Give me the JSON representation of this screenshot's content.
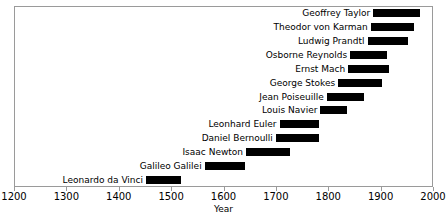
{
  "chart_data": {
    "type": "bar",
    "orientation": "horizontal-range",
    "title": "",
    "xlabel": "Year",
    "ylabel": "",
    "xlim": [
      1200,
      2000
    ],
    "xticks": [
      1200,
      1300,
      1400,
      1500,
      1600,
      1700,
      1800,
      1900,
      2000
    ],
    "xticklabels": [
      "1200",
      "1300",
      "1400",
      "1500",
      "1600",
      "1700",
      "1800",
      "1900",
      "2000"
    ],
    "grid": false,
    "legend": null,
    "categories": [
      "Geoffrey Taylor",
      "Theodor von Karman",
      "Ludwig Prandtl",
      "Osborne Reynolds",
      "Ernst Mach",
      "George Stokes",
      "Jean Poiseuille",
      "Louis Navier",
      "Leonhard Euler",
      "Daniel Bernoulli",
      "Isaac Newton",
      "Galileo Galilei",
      "Leonardo da Vinci"
    ],
    "bars": [
      {
        "label": "Geoffrey Taylor",
        "start": 1886,
        "end": 1975
      },
      {
        "label": "Theodor von Karman",
        "start": 1881,
        "end": 1963
      },
      {
        "label": "Ludwig Prandtl",
        "start": 1875,
        "end": 1953
      },
      {
        "label": "Osborne Reynolds",
        "start": 1842,
        "end": 1912
      },
      {
        "label": "Ernst Mach",
        "start": 1838,
        "end": 1916
      },
      {
        "label": "George Stokes",
        "start": 1819,
        "end": 1903
      },
      {
        "label": "Jean Poiseuille",
        "start": 1797,
        "end": 1869
      },
      {
        "label": "Louis Navier",
        "start": 1785,
        "end": 1836
      },
      {
        "label": "Leonhard Euler",
        "start": 1707,
        "end": 1783
      },
      {
        "label": "Daniel Bernoulli",
        "start": 1700,
        "end": 1782
      },
      {
        "label": "Isaac Newton",
        "start": 1643,
        "end": 1727
      },
      {
        "label": "Galileo Galilei",
        "start": 1564,
        "end": 1642
      },
      {
        "label": "Leonardo da Vinci",
        "start": 1452,
        "end": 1519
      }
    ],
    "colors": {
      "bar": "#000000",
      "axis": "#9a9a9a",
      "text": "#000000",
      "background": "#ffffff"
    }
  }
}
